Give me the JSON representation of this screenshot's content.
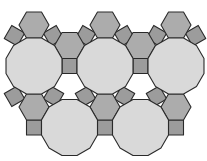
{
  "figure": {
    "title": "",
    "type": "truncated trihexagonal tiling (4.6.12)",
    "width": 207,
    "height": 161,
    "edge_length": 15,
    "colors": {
      "background": "#ffffff",
      "dodecagon": "#d9d9d9",
      "hexagon": "#acacac",
      "square": "#9c9c9c",
      "outline": "#2a2a2a"
    },
    "dodecagons": [
      {
        "cx": 34,
        "cy": 66
      },
      {
        "cx": 105,
        "cy": 66
      },
      {
        "cx": 176,
        "cy": 66
      },
      {
        "cx": 69.5,
        "cy": 127.5
      },
      {
        "cx": 140.5,
        "cy": 127.5
      }
    ],
    "hexagons": [
      {
        "cx": 34,
        "cy": 25
      },
      {
        "cx": 105,
        "cy": 25
      },
      {
        "cx": 176,
        "cy": 25
      },
      {
        "cx": 69.5,
        "cy": 45.5
      },
      {
        "cx": 140.5,
        "cy": 45.5
      },
      {
        "cx": 34,
        "cy": 107
      },
      {
        "cx": 105,
        "cy": 107
      },
      {
        "cx": 176,
        "cy": 107
      }
    ],
    "squares": [
      {
        "cx": 14.5,
        "cy": 35.7,
        "angle": 30
      },
      {
        "cx": 53.5,
        "cy": 35.7,
        "angle": -30
      },
      {
        "cx": 85.5,
        "cy": 35.7,
        "angle": 30
      },
      {
        "cx": 124.5,
        "cy": 35.7,
        "angle": -30
      },
      {
        "cx": 156.5,
        "cy": 35.7,
        "angle": 30
      },
      {
        "cx": 195.5,
        "cy": 35.7,
        "angle": -30
      },
      {
        "cx": 69.5,
        "cy": 66,
        "angle": 0
      },
      {
        "cx": 140.5,
        "cy": 66,
        "angle": 0
      },
      {
        "cx": 14.5,
        "cy": 96.3,
        "angle": -30
      },
      {
        "cx": 53.5,
        "cy": 96.3,
        "angle": 30
      },
      {
        "cx": 85.5,
        "cy": 96.3,
        "angle": -30
      },
      {
        "cx": 124.5,
        "cy": 96.3,
        "angle": 30
      },
      {
        "cx": 156.5,
        "cy": 96.3,
        "angle": -30
      },
      {
        "cx": 34,
        "cy": 127.5,
        "angle": 0
      },
      {
        "cx": 105,
        "cy": 127.5,
        "angle": 0
      },
      {
        "cx": 176,
        "cy": 127.5,
        "angle": 0
      }
    ]
  }
}
